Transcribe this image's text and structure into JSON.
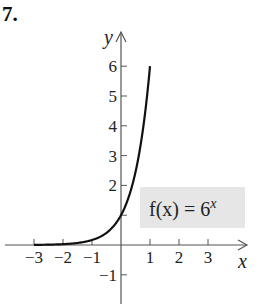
{
  "problem": {
    "number": "7."
  },
  "chart_data": {
    "type": "line",
    "title": "",
    "function_label": "f(x) = 6^x",
    "function_label_parts": {
      "lhs": "f(x) = 6",
      "exponent": "x"
    },
    "xlabel": "x",
    "ylabel": "y",
    "xlim": [
      -4,
      4.5
    ],
    "ylim": [
      -2,
      7
    ],
    "x_ticks": [
      -3,
      -2,
      -1,
      1,
      2,
      3
    ],
    "x_tick_labels": [
      "−3",
      "−2",
      "−1",
      "1",
      "2",
      "3"
    ],
    "y_ticks": [
      -1,
      1,
      2,
      3,
      4,
      5,
      6
    ],
    "y_tick_labels": [
      "−1",
      "",
      "2",
      "3",
      "4",
      "5",
      "6"
    ],
    "grid": false,
    "legend": "label box at right, inside plot",
    "series": [
      {
        "name": "f(x) = 6^x",
        "color": "#111111",
        "x": [
          -3,
          -2.5,
          -2,
          -1.5,
          -1,
          -0.5,
          0,
          0.25,
          0.5,
          0.75,
          1
        ],
        "y": [
          0.0046,
          0.0113,
          0.0278,
          0.068,
          0.1667,
          0.408,
          1,
          1.565,
          2.449,
          3.834,
          6
        ]
      }
    ],
    "label_box_color": "#e6e6e6"
  }
}
